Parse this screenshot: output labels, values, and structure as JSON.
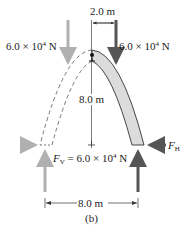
{
  "diagram": {
    "caption": "(b)",
    "dimensions": {
      "top_offset": "2.0 m",
      "height": "8.0 m",
      "span": "8.0 m"
    },
    "forces": {
      "left_load": {
        "mantissa": "6.0 × 10",
        "exp": "4",
        "unit": " N"
      },
      "right_load": {
        "mantissa": "6.0 × 10",
        "exp": "4",
        "unit": " N"
      },
      "vertical_reaction": {
        "symbol": "F",
        "sub": "V",
        "value": " = 6.0 × 10",
        "exp": "4",
        "unit": " N"
      },
      "horizontal_reaction": {
        "symbol": "F",
        "sub": "H"
      }
    },
    "colors": {
      "dark_arrow": "#555555",
      "light_arrow": "#b0b0b0",
      "arch_fill": "#dcdcdc",
      "line": "#333333"
    }
  }
}
